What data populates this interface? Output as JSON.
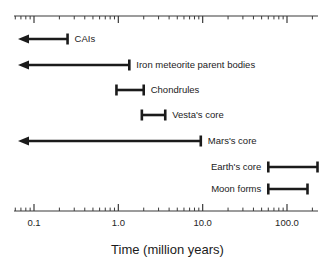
{
  "figure": {
    "background_color": "#ffffff",
    "stroke_color": "#1b1b1b",
    "axis_color": "#3a3a3a"
  },
  "chart_data": {
    "type": "bar",
    "orientation": "horizontal",
    "title": "",
    "xlabel": "Time (million years)",
    "ylabel": "",
    "xscale": "log",
    "xlim": [
      0.05,
      300
    ],
    "grid": false,
    "legend": null,
    "tick_labels": [
      "0.1",
      "1.0",
      "10.0",
      "100.0"
    ],
    "tick_values": [
      0.1,
      1.0,
      10.0,
      100.0
    ],
    "minor_ticks": true,
    "axes": [
      "top",
      "bottom"
    ],
    "categories": [
      "CAIs",
      "Iron meteorite parent bodies",
      "Chondrules",
      "Vesta's core",
      "Mars's core",
      "Earth's core",
      "Moon forms"
    ],
    "bars": [
      {
        "label": "CAIs",
        "start": 0.06,
        "end": 0.25,
        "start_open": true,
        "end_open": false,
        "label_side": "right"
      },
      {
        "label": "Iron meteorite parent bodies",
        "start": 0.06,
        "end": 1.35,
        "start_open": true,
        "end_open": false,
        "label_side": "right"
      },
      {
        "label": "Chondrules",
        "start": 0.95,
        "end": 2.0,
        "start_open": false,
        "end_open": false,
        "label_side": "right"
      },
      {
        "label": "Vesta's core",
        "start": 1.9,
        "end": 3.6,
        "start_open": false,
        "end_open": false,
        "label_side": "right"
      },
      {
        "label": "Mars's core",
        "start": 0.06,
        "end": 9.5,
        "start_open": true,
        "end_open": false,
        "label_side": "right"
      },
      {
        "label": "Earth's core",
        "start": 60.0,
        "end": 230.0,
        "start_open": false,
        "end_open": false,
        "label_side": "left"
      },
      {
        "label": "Moon forms",
        "start": 60.0,
        "end": 175.0,
        "start_open": false,
        "end_open": false,
        "label_side": "left"
      }
    ]
  },
  "geometry": {
    "rows_y": [
      39,
      65,
      90,
      115,
      141,
      167,
      189
    ],
    "axis_top_y": 16,
    "axis_bottom_y": 211,
    "tick_label_y": 218,
    "decade_px": [
      34,
      130,
      212,
      287
    ],
    "plot_left": 18,
    "plot_right": 318
  }
}
